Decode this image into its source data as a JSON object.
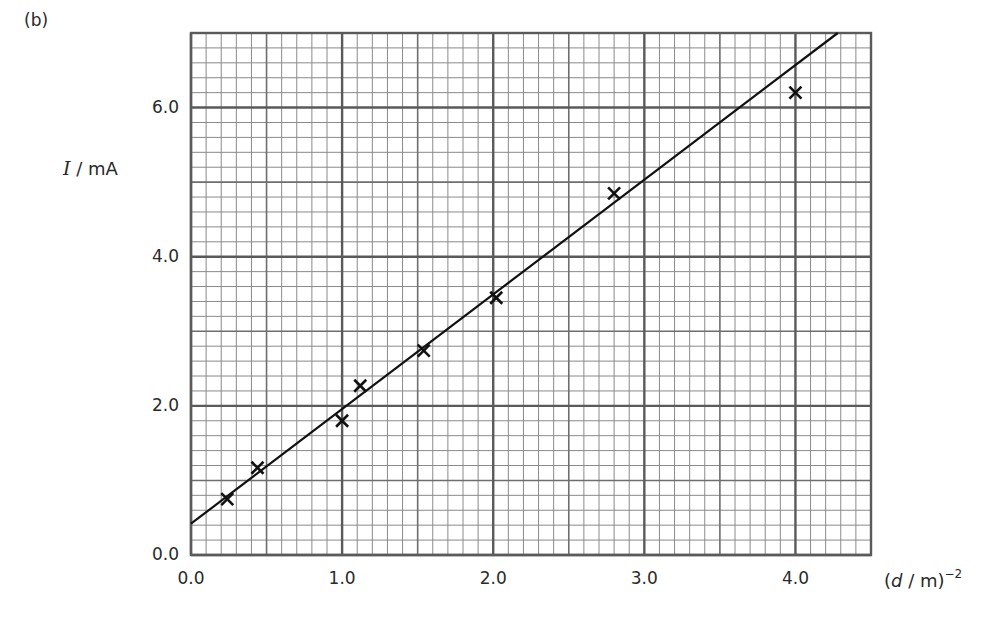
{
  "part_label": "(b)",
  "chart_data": {
    "type": "scatter",
    "title": "",
    "xlabel": "(d / m)^-2",
    "xlabel_parts": {
      "open": "(",
      "symbol": "d",
      "unit": " / m)",
      "exponent": "−2"
    },
    "ylabel": "I / mA",
    "ylabel_parts": {
      "symbol": "I",
      "unit": " / mA"
    },
    "xlim": [
      0.0,
      4.5
    ],
    "ylim": [
      0.0,
      7.0
    ],
    "x_ticks": [
      "0.0",
      "1.0",
      "2.0",
      "3.0",
      "4.0"
    ],
    "x_tick_values": [
      0.0,
      1.0,
      2.0,
      3.0,
      4.0
    ],
    "y_ticks": [
      "0.0",
      "2.0",
      "4.0",
      "6.0"
    ],
    "y_tick_values": [
      0.0,
      2.0,
      4.0,
      6.0
    ],
    "grid": {
      "on": true,
      "style": "graph paper",
      "x_minor_step": 0.1,
      "x_medium_step": 0.5,
      "x_major_step": 1.0,
      "y_minor_step": 0.2,
      "y_medium_step": 1.0,
      "y_major_step": 2.0
    },
    "legend": null,
    "series": [
      {
        "name": "measurements",
        "marker": "x",
        "x": [
          0.24,
          0.44,
          1.0,
          1.12,
          1.54,
          2.02,
          2.8,
          4.0
        ],
        "y": [
          0.75,
          1.17,
          1.8,
          2.27,
          2.74,
          3.45,
          4.85,
          6.2
        ]
      },
      {
        "name": "best-fit line",
        "type": "line",
        "x": [
          0.0,
          4.28
        ],
        "y": [
          0.42,
          7.0
        ],
        "slope": 1.54,
        "intercept": 0.42
      }
    ]
  }
}
